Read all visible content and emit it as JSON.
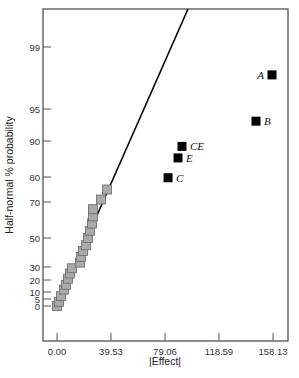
{
  "chart_data": {
    "type": "scatter",
    "title": "",
    "xlabel": "|Effect|",
    "ylabel": "Half-normal % probability",
    "x_ticks": [
      {
        "label": "0.00",
        "value": 0.0
      },
      {
        "label": "39.53",
        "value": 39.53
      },
      {
        "label": "79.06",
        "value": 79.06
      },
      {
        "label": "118.59",
        "value": 118.59
      },
      {
        "label": "158.13",
        "value": 158.13
      }
    ],
    "y_ticks": [
      {
        "label": "0",
        "value": 0
      },
      {
        "label": "5",
        "value": 5
      },
      {
        "label": "10",
        "value": 10
      },
      {
        "label": "20",
        "value": 20
      },
      {
        "label": "30",
        "value": 30
      },
      {
        "label": "50",
        "value": 50
      },
      {
        "label": "70",
        "value": 70
      },
      {
        "label": "80",
        "value": 80
      },
      {
        "label": "90",
        "value": 90
      },
      {
        "label": "95",
        "value": 95
      },
      {
        "label": "99",
        "value": 99
      }
    ],
    "grid": false,
    "legend": null,
    "series": [
      {
        "name": "insignificant effects",
        "color": "#aaaaaa",
        "marker": "square",
        "points": [
          {
            "x": 0.0,
            "y": 0
          },
          {
            "x": 1.5,
            "y": 3
          },
          {
            "x": 2.9,
            "y": 7
          },
          {
            "x": 5.1,
            "y": 12
          },
          {
            "x": 6.6,
            "y": 16
          },
          {
            "x": 8.1,
            "y": 21
          },
          {
            "x": 9.5,
            "y": 25
          },
          {
            "x": 11.0,
            "y": 29
          },
          {
            "x": 16.8,
            "y": 33
          },
          {
            "x": 17.6,
            "y": 37
          },
          {
            "x": 19.0,
            "y": 41
          },
          {
            "x": 21.2,
            "y": 45
          },
          {
            "x": 22.7,
            "y": 50
          },
          {
            "x": 24.2,
            "y": 54
          },
          {
            "x": 25.6,
            "y": 58
          },
          {
            "x": 26.4,
            "y": 62
          },
          {
            "x": 26.4,
            "y": 66
          },
          {
            "x": 32.2,
            "y": 71
          },
          {
            "x": 36.6,
            "y": 75
          }
        ]
      },
      {
        "name": "significant effects",
        "color": "#000000",
        "marker": "square",
        "points": [
          {
            "label": "A",
            "x": 157.4,
            "y": 97.2,
            "label_side": "left"
          },
          {
            "label": "B",
            "x": 145.7,
            "y": 93.1,
            "label_side": "right"
          },
          {
            "label": "CE",
            "x": 91.5,
            "y": 88.5,
            "label_side": "right"
          },
          {
            "label": "E",
            "x": 88.6,
            "y": 85.3,
            "label_side": "right"
          },
          {
            "label": "C",
            "x": 81.3,
            "y": 79.7,
            "label_side": "right"
          }
        ]
      }
    ],
    "fit_line": {
      "from": {
        "x": 0.0,
        "y": 0
      },
      "to": {
        "x": 96.0,
        "y": 99.9
      },
      "color": "#000000"
    },
    "xlim": [
      -10.4,
      168.5
    ],
    "ylim": [
      0,
      99.9
    ]
  }
}
